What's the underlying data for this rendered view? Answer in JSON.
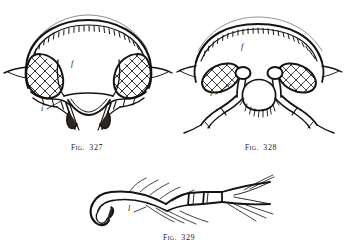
{
  "page": {
    "background_color": "#ffffff",
    "ink_color": "#161412",
    "medium": "engraved ink line drawings on book page"
  },
  "figures": [
    {
      "id": "fig-327",
      "caption_prefix": "F",
      "caption_small_caps": "IG",
      "caption_punct": ".",
      "caption_number": "327",
      "caption_full": "FIG. 327",
      "subject": "insect head, anterior view, with large compound eyes",
      "labels": [
        {
          "key": "f",
          "text": "f",
          "meaning": "frons"
        },
        {
          "key": "i",
          "text": "i",
          "meaning": "insertion / antennal socket"
        }
      ]
    },
    {
      "id": "fig-328",
      "caption_prefix": "F",
      "caption_small_caps": "IG",
      "caption_punct": ".",
      "caption_number": "328",
      "caption_full": "FIG. 328",
      "subject": "insect head, anterior view, broad frons with hairy clypeus",
      "labels": [
        {
          "key": "f",
          "text": "f",
          "meaning": "frons"
        },
        {
          "key": "i",
          "text": "i",
          "meaning": "insertion / antennal socket"
        }
      ]
    },
    {
      "id": "fig-329",
      "caption_prefix": "F",
      "caption_small_caps": "IG",
      "caption_punct": ".",
      "caption_number": "329",
      "caption_full": "FIG. 329",
      "subject": "insect tarsus and pretarsus with curved claw and setae",
      "labels": [
        {
          "key": "l",
          "text": "l",
          "meaning": "claw / pretarsal structure"
        }
      ]
    }
  ]
}
